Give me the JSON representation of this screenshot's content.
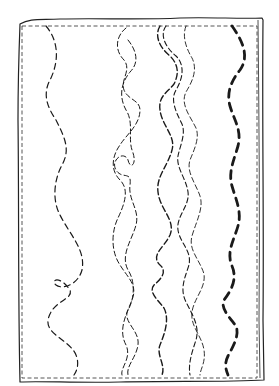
{
  "illustration": {
    "description": "Hand-drawn rectangle with wavy dashed lines of increasing weight",
    "colors": {
      "ink": "#1a1a1a",
      "background": "#ffffff"
    },
    "lines": [
      {
        "name": "line-1",
        "weight": "thin-dash",
        "stroke_width": 1.2,
        "dash": "6 4",
        "d": "M46 26 C58 40 60 60 50 80 C42 95 48 108 56 120 C66 140 70 150 62 165 C54 180 52 200 60 215 C70 235 86 250 82 270 C78 285 62 290 56 285 C50 280 60 275 70 290 C74 300 52 300 48 320 C46 335 70 340 76 355 C80 365 76 372 74 375"
      },
      {
        "name": "line-2",
        "weight": "thin-dash",
        "stroke_width": 1,
        "dash": "5 3",
        "d": "M126 28 C116 36 114 50 124 60 C132 70 120 80 124 90 C128 100 140 100 140 110 C140 125 126 135 120 145 C112 156 110 170 120 180 C130 190 124 205 118 218 C112 230 110 250 120 265 C128 278 138 285 132 300 C126 315 118 330 126 345 C132 358 120 368 122 375"
      },
      {
        "name": "line-3",
        "weight": "thin-dash",
        "stroke_width": 1,
        "dash": "5 3",
        "d": "M128 40 C136 50 140 62 130 72 C122 82 118 95 126 110 C134 122 128 138 132 150 C138 165 130 170 128 160 C124 150 110 160 116 170 C122 180 132 170 130 185 C128 200 140 210 136 225 C132 240 120 255 128 270 C136 282 134 300 128 310 C122 322 140 330 138 345 C136 358 126 366 128 375"
      },
      {
        "name": "line-4",
        "weight": "medium-dash",
        "stroke_width": 1.4,
        "dash": "6 3",
        "d": "M160 26 C154 36 160 48 170 56 C180 66 178 76 174 84 C168 92 158 96 160 110 C162 126 176 136 172 150 C168 166 156 176 158 192 C160 210 176 220 170 235 C164 248 150 255 160 265 C168 272 160 280 154 285 C148 292 158 300 164 308 C170 320 164 335 160 345 C156 355 166 365 162 375"
      },
      {
        "name": "line-5",
        "weight": "thin-dash",
        "stroke_width": 1.1,
        "dash": "5 3",
        "d": "M166 26 C160 34 164 46 176 56 C186 66 182 80 176 90 C170 100 176 112 182 124 C186 134 180 146 178 156 C176 168 186 178 188 192 C190 206 176 216 178 230 C180 244 194 252 188 268 C184 280 180 290 186 302 C192 314 200 326 196 340 C192 352 188 364 190 375"
      },
      {
        "name": "line-6",
        "weight": "thin-dash",
        "stroke_width": 0.9,
        "dash": "5 3",
        "d": "M186 26 C182 36 186 48 192 58 C198 70 192 82 186 92 C180 104 190 116 196 128 C200 138 194 150 190 160 C186 172 196 184 200 196 C204 208 196 222 192 236 C188 250 200 260 204 274 C206 288 194 298 192 312 C190 326 202 336 204 350 C206 362 200 370 200 375"
      },
      {
        "name": "line-7",
        "weight": "bold-dash",
        "stroke_width": 2.8,
        "dash": "8 6",
        "d": "M232 26 C242 40 250 56 240 70 C232 80 226 92 230 106 C234 120 242 130 238 146 C234 160 228 172 232 186 C236 200 242 212 238 226 C234 240 226 252 232 266 C238 280 230 292 224 300 C220 308 230 318 236 326 C240 336 232 348 228 356 C224 364 226 370 228 375"
      }
    ]
  }
}
